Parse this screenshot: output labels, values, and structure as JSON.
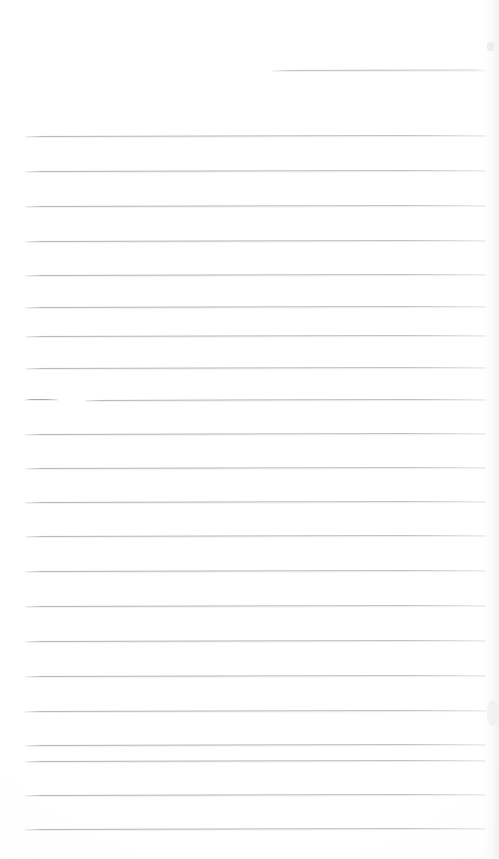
{
  "document": {
    "title": "Scanned blank ruled notebook page",
    "kind": "scanned-page",
    "page_width": 499,
    "page_height": 859,
    "background_color": "#ffffff",
    "rule_color": "#a8a8a8",
    "rule_color_light": "#d6d6d6",
    "edge_shadow_color": "#e4e4e4",
    "visible_text": "",
    "text_content_note": "No written or printed text is present on the page."
  },
  "ruling": {
    "style": "horizontal ruled lines",
    "line_count": 22,
    "line_spacing_px": 35,
    "left_margin_px": 25,
    "right_margin_px": 485,
    "skew_degrees": -0.13,
    "first_full_line_y": 136,
    "last_full_line_y": 829,
    "lines": [
      {
        "id": "rule-partial-top",
        "y": 70,
        "x1": 272,
        "x2": 486,
        "variant": "partial-top",
        "note": "short rule, right half of page only"
      },
      {
        "id": "rule-01",
        "y": 136,
        "x1": 25,
        "x2": 486,
        "variant": "full"
      },
      {
        "id": "rule-02",
        "y": 171,
        "x1": 25,
        "x2": 486,
        "variant": "full"
      },
      {
        "id": "rule-03",
        "y": 206,
        "x1": 25,
        "x2": 486,
        "variant": "full"
      },
      {
        "id": "rule-04",
        "y": 241,
        "x1": 25,
        "x2": 486,
        "variant": "full"
      },
      {
        "id": "rule-05",
        "y": 275,
        "x1": 25,
        "x2": 486,
        "variant": "full"
      },
      {
        "id": "rule-06",
        "y": 307,
        "x1": 25,
        "x2": 486,
        "variant": "full"
      },
      {
        "id": "rule-07",
        "y": 336,
        "x1": 25,
        "x2": 486,
        "variant": "full"
      },
      {
        "id": "rule-08",
        "y": 368,
        "x1": 25,
        "x2": 486,
        "variant": "full"
      },
      {
        "id": "rule-09a",
        "y": 399,
        "x1": 25,
        "x2": 58,
        "variant": "stub",
        "note": "broken line: short left stub"
      },
      {
        "id": "rule-09b",
        "y": 400,
        "x1": 85,
        "x2": 486,
        "variant": "full",
        "note": "broken line: resumes after gap"
      },
      {
        "id": "rule-10",
        "y": 434,
        "x1": 25,
        "x2": 486,
        "variant": "full"
      },
      {
        "id": "rule-11",
        "y": 468,
        "x1": 25,
        "x2": 486,
        "variant": "full"
      },
      {
        "id": "rule-12",
        "y": 502,
        "x1": 25,
        "x2": 486,
        "variant": "full"
      },
      {
        "id": "rule-13",
        "y": 536,
        "x1": 25,
        "x2": 486,
        "variant": "full"
      },
      {
        "id": "rule-14",
        "y": 571,
        "x1": 25,
        "x2": 486,
        "variant": "full"
      },
      {
        "id": "rule-15",
        "y": 606,
        "x1": 25,
        "x2": 486,
        "variant": "full"
      },
      {
        "id": "rule-16",
        "y": 641,
        "x1": 25,
        "x2": 486,
        "variant": "full"
      },
      {
        "id": "rule-17",
        "y": 676,
        "x1": 25,
        "x2": 486,
        "variant": "full"
      },
      {
        "id": "rule-18",
        "y": 711,
        "x1": 25,
        "x2": 486,
        "variant": "full"
      },
      {
        "id": "rule-19",
        "y": 745,
        "x1": 25,
        "x2": 486,
        "variant": "full"
      },
      {
        "id": "rule-20",
        "y": 761,
        "x1": 25,
        "x2": 486,
        "variant": "full"
      },
      {
        "id": "rule-21",
        "y": 795,
        "x1": 25,
        "x2": 486,
        "variant": "full"
      },
      {
        "id": "rule-22",
        "y": 829,
        "x1": 25,
        "x2": 486,
        "variant": "full"
      }
    ]
  },
  "artifacts": [
    {
      "id": "top-right-speck",
      "name": "scanner-speck",
      "x": 487,
      "y": 42
    },
    {
      "id": "mid-right-speck",
      "name": "page-edge-highlight",
      "x": 488,
      "y": 700
    },
    {
      "id": "right-edge-shadow",
      "name": "page-edge-shadow",
      "x": 483,
      "y": 0
    }
  ]
}
